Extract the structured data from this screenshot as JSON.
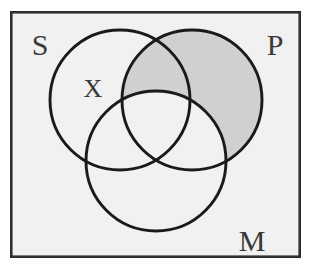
{
  "figure": {
    "kind": "venn-diagram-3-set",
    "background_color": "#ffffff",
    "panel_fill": "#f1f1f1",
    "border_color": "#2b2b2b",
    "circle_stroke_color": "#1a1a1a",
    "shade_color": "#cfcfcf",
    "label_color": "#3a3a3a"
  },
  "panel": {
    "x": 10,
    "y": 11,
    "width": 291,
    "height": 247,
    "border_width": 2.6
  },
  "circles": [
    {
      "id": "S",
      "label": "S",
      "cx": 120,
      "cy": 100,
      "r": 70
    },
    {
      "id": "P",
      "label": "P",
      "cx": 192,
      "cy": 100,
      "r": 70
    },
    {
      "id": "M",
      "label": "M",
      "cx": 156,
      "cy": 161,
      "r": 70
    }
  ],
  "labels": {
    "set_s": {
      "text": "S",
      "x": 40,
      "y": 44
    },
    "set_p": {
      "text": "P",
      "x": 275,
      "y": 44
    },
    "set_m": {
      "text": "M",
      "x": 252,
      "y": 240
    },
    "mark_x": {
      "text": "X",
      "x": 93,
      "y": 88
    }
  },
  "shading": {
    "description": "P minus M",
    "regions_shaded": [
      "P only",
      "S and P but not M"
    ],
    "regions_unshaded": [
      "S only",
      "M only",
      "S and M not P",
      "P and M not S",
      "S and P and M"
    ],
    "color": "#cfcfcf",
    "opacity": 1
  },
  "chart_data": {
    "type": "venn",
    "sets": [
      "S",
      "P",
      "M"
    ],
    "set_positions": {
      "S": "top-left",
      "P": "top-right",
      "M": "bottom-center"
    },
    "marks": [
      {
        "symbol": "X",
        "region": "S only",
        "meaning": "element in S but not P and not M"
      }
    ],
    "shaded_regions": [
      "P ∩ ~M"
    ],
    "legend": [],
    "xlabel": "",
    "ylabel": ""
  }
}
